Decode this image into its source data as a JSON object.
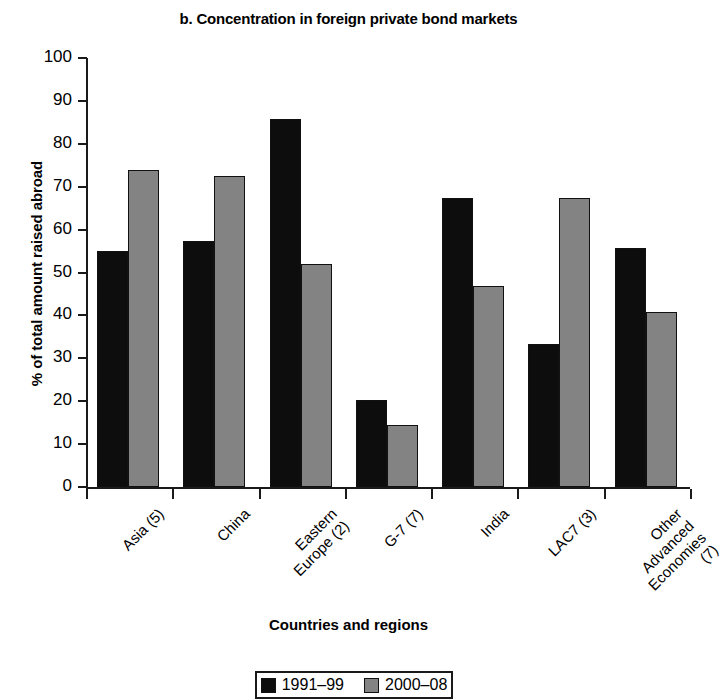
{
  "chart_data": {
    "type": "bar",
    "title": "b. Concentration in foreign private bond markets",
    "xlabel": "Countries and regions",
    "ylabel": "% of total amount raised abroad",
    "ylim": [
      0,
      100
    ],
    "ytick_labels": [
      "100",
      "90",
      "80",
      "70",
      "60",
      "50",
      "40",
      "30",
      "20",
      "10",
      "0"
    ],
    "yticks": [
      100,
      90,
      80,
      70,
      60,
      50,
      40,
      30,
      20,
      10,
      0
    ],
    "grid": false,
    "legend_position": "bottom-center",
    "categories": [
      "Asia (5)",
      "China",
      "Eastern\nEurope (2)",
      "G-7 (7)",
      "India",
      "LAC7 (3)",
      "Other Advanced\nEconomies (7)"
    ],
    "series": [
      {
        "name": "1991–99",
        "color": "#0d0d0d",
        "values": [
          55.0,
          57.4,
          85.8,
          20.2,
          67.4,
          33.3,
          55.6
        ]
      },
      {
        "name": "2000–08",
        "color": "#838383",
        "values": [
          73.8,
          72.6,
          51.9,
          14.5,
          46.8,
          67.4,
          40.9
        ]
      }
    ]
  }
}
